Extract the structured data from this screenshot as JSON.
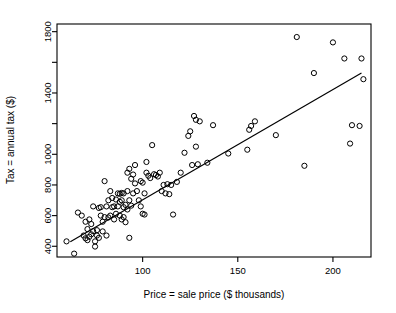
{
  "chart_data": {
    "type": "scatter",
    "title": "",
    "xlabel": "Price = sale price ($ thousands)",
    "ylabel": "Tax = annual tax ($)",
    "xlim": [
      55,
      220
    ],
    "ylim": [
      330,
      1850
    ],
    "grid": false,
    "legend": null,
    "x_ticks": [
      100,
      150,
      200
    ],
    "x_tick_labels": [
      "100",
      "150",
      "200"
    ],
    "y_ticks": [
      400,
      600,
      800,
      1000,
      1200,
      1400,
      1600,
      1800
    ],
    "y_tick_labels": [
      "400",
      "600",
      "800",
      "1000",
      "",
      "1400",
      "",
      "1800"
    ],
    "marker": "open-circle",
    "marker_color": "#000000",
    "line_color": "#000000",
    "regression_line": {
      "name": "least-squares fit",
      "x0": 62,
      "y0": 430,
      "x1": 215,
      "y1": 1530
    },
    "series": [
      {
        "name": "homes",
        "points": [
          [
            60,
            432
          ],
          [
            64,
            352
          ],
          [
            66,
            620
          ],
          [
            68,
            600
          ],
          [
            69,
            470
          ],
          [
            70,
            560
          ],
          [
            70,
            452
          ],
          [
            71,
            440
          ],
          [
            71,
            512
          ],
          [
            72,
            575
          ],
          [
            72,
            462
          ],
          [
            73,
            545
          ],
          [
            73,
            478
          ],
          [
            74,
            660
          ],
          [
            74,
            498
          ],
          [
            75,
            432
          ],
          [
            75,
            398
          ],
          [
            76,
            470
          ],
          [
            76,
            505
          ],
          [
            77,
            650
          ],
          [
            77,
            455
          ],
          [
            78,
            655
          ],
          [
            78,
            600
          ],
          [
            79,
            497
          ],
          [
            79,
            560
          ],
          [
            80,
            825
          ],
          [
            80,
            590
          ],
          [
            81,
            660
          ],
          [
            81,
            470
          ],
          [
            82,
            700
          ],
          [
            82,
            588
          ],
          [
            83,
            760
          ],
          [
            83,
            600
          ],
          [
            84,
            715
          ],
          [
            84,
            655
          ],
          [
            85,
            660
          ],
          [
            85,
            575
          ],
          [
            86,
            705
          ],
          [
            86,
            612
          ],
          [
            87,
            745
          ],
          [
            87,
            660
          ],
          [
            88,
            742
          ],
          [
            88,
            690
          ],
          [
            88,
            600
          ],
          [
            89,
            748
          ],
          [
            89,
            700
          ],
          [
            89,
            575
          ],
          [
            90,
            745
          ],
          [
            90,
            655
          ],
          [
            90,
            590
          ],
          [
            91,
            670
          ],
          [
            91,
            557
          ],
          [
            92,
            880
          ],
          [
            92,
            760
          ],
          [
            92,
            640
          ],
          [
            93,
            905
          ],
          [
            93,
            700
          ],
          [
            93,
            455
          ],
          [
            94,
            840
          ],
          [
            94,
            665
          ],
          [
            95,
            868
          ],
          [
            95,
            745
          ],
          [
            96,
            930
          ],
          [
            96,
            810
          ],
          [
            97,
            760
          ],
          [
            98,
            700
          ],
          [
            99,
            825
          ],
          [
            99,
            660
          ],
          [
            100,
            815
          ],
          [
            100,
            612
          ],
          [
            101,
            745
          ],
          [
            101,
            607
          ],
          [
            102,
            950
          ],
          [
            102,
            880
          ],
          [
            103,
            860
          ],
          [
            104,
            845
          ],
          [
            105,
            1060
          ],
          [
            106,
            870
          ],
          [
            107,
            865
          ],
          [
            108,
            855
          ],
          [
            109,
            880
          ],
          [
            110,
            760
          ],
          [
            111,
            800
          ],
          [
            112,
            745
          ],
          [
            113,
            805
          ],
          [
            114,
            740
          ],
          [
            115,
            800
          ],
          [
            116,
            607
          ],
          [
            118,
            820
          ],
          [
            120,
            880
          ],
          [
            122,
            1010
          ],
          [
            124,
            1120
          ],
          [
            125,
            1150
          ],
          [
            126,
            930
          ],
          [
            127,
            1250
          ],
          [
            128,
            1050
          ],
          [
            128,
            1225
          ],
          [
            129,
            935
          ],
          [
            130,
            1215
          ],
          [
            134,
            945
          ],
          [
            137,
            1190
          ],
          [
            145,
            1005
          ],
          [
            155,
            1030
          ],
          [
            156,
            1160
          ],
          [
            157,
            1185
          ],
          [
            159,
            1215
          ],
          [
            170,
            1125
          ],
          [
            181,
            1765
          ],
          [
            185,
            925
          ],
          [
            190,
            1530
          ],
          [
            200,
            1730
          ],
          [
            206,
            1625
          ],
          [
            209,
            1070
          ],
          [
            210,
            1190
          ],
          [
            214,
            1185
          ],
          [
            215,
            1625
          ],
          [
            216,
            1490
          ]
        ]
      }
    ]
  }
}
